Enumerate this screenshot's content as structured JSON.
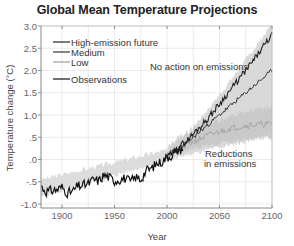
{
  "chart_data": {
    "type": "line",
    "title": "Global Mean Temperature Projections",
    "xlabel": "Year",
    "ylabel": "Temperature change (°C)",
    "xlim": [
      1880,
      2100
    ],
    "ylim": [
      -1.0,
      3.0
    ],
    "x_ticks": [
      1900,
      1950,
      2000,
      2050,
      2100
    ],
    "x_tick_labels": [
      "1900",
      "1950",
      "2000",
      "2050",
      "2100"
    ],
    "y_ticks": [
      3.0,
      2.5,
      2.0,
      1.5,
      1.0,
      0.5,
      0.0,
      -0.5,
      -1.0
    ],
    "y_tick_labels": [
      "3.0",
      "2.5",
      "2.0",
      "1.5",
      "1.0",
      ".5",
      ".0",
      "-.5",
      "-1.0"
    ],
    "grid": true,
    "legend_position": "upper-left",
    "legend": [
      "High-emission future",
      "Medium",
      "Low",
      "Observations"
    ],
    "annotations": [
      {
        "text": "No action on emissions",
        "x": 2045,
        "y": 2.1
      },
      {
        "text": "Reductions",
        "x": 2060,
        "y": 0.35
      },
      {
        "text": "in emissions",
        "x": 2060,
        "y": 0.15
      }
    ],
    "series": [
      {
        "name": "Observations",
        "color": "#111111",
        "x": [
          1880,
          1885,
          1890,
          1895,
          1900,
          1905,
          1910,
          1915,
          1920,
          1925,
          1930,
          1935,
          1940,
          1945,
          1950,
          1955,
          1960,
          1965,
          1970,
          1975,
          1980,
          1985,
          1990,
          1995,
          2000,
          2005,
          2010,
          2015
        ],
        "values": [
          -0.6,
          -0.72,
          -0.7,
          -0.68,
          -0.62,
          -0.75,
          -0.72,
          -0.6,
          -0.58,
          -0.55,
          -0.45,
          -0.48,
          -0.35,
          -0.4,
          -0.48,
          -0.45,
          -0.42,
          -0.5,
          -0.4,
          -0.45,
          -0.25,
          -0.2,
          -0.1,
          -0.05,
          0.05,
          0.1,
          0.2,
          0.25
        ]
      },
      {
        "name": "High-emission future",
        "color": "#222222",
        "x": [
          2000,
          2020,
          2040,
          2060,
          2080,
          2100
        ],
        "values": [
          0.05,
          0.45,
          0.95,
          1.55,
          2.15,
          2.8
        ]
      },
      {
        "name": "Medium",
        "color": "#333333",
        "x": [
          2000,
          2020,
          2040,
          2060,
          2080,
          2100
        ],
        "values": [
          0.05,
          0.4,
          0.8,
          1.2,
          1.6,
          2.0
        ]
      },
      {
        "name": "Low",
        "color": "#999999",
        "x": [
          2000,
          2020,
          2040,
          2060,
          2080,
          2100
        ],
        "values": [
          0.05,
          0.35,
          0.55,
          0.7,
          0.78,
          0.8
        ]
      }
    ],
    "bands": [
      {
        "name": "High-emission range",
        "x": [
          2000,
          2100
        ],
        "lower": [
          0.0,
          0.6
        ],
        "upper": [
          0.15,
          3.0
        ]
      },
      {
        "name": "Low range",
        "x": [
          2000,
          2100
        ],
        "lower": [
          0.0,
          0.5
        ],
        "upper": [
          0.15,
          1.2
        ]
      }
    ]
  },
  "colors": {
    "observations": "#111111",
    "high": "#222222",
    "medium": "#333333",
    "low": "#a0a0a0",
    "band_high": "#d9d9d9",
    "band_low": "#c4c4c4",
    "grid": "#e6e6e6"
  }
}
